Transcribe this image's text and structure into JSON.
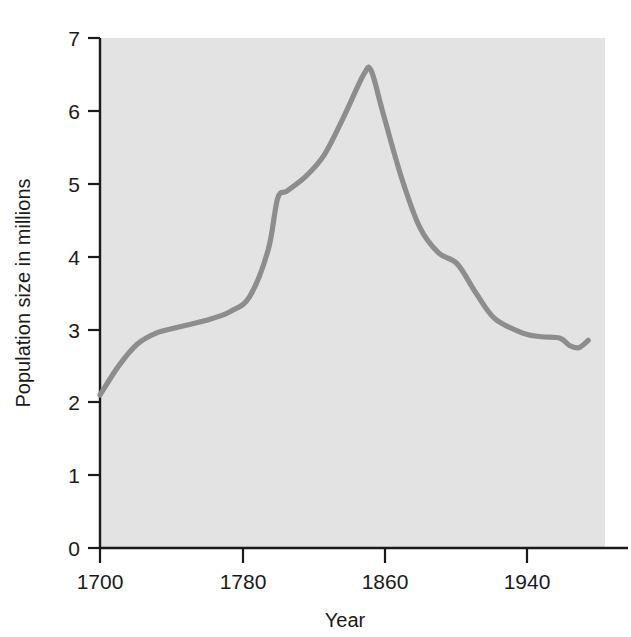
{
  "chart_data": {
    "type": "line",
    "title": "",
    "xlabel": "Year",
    "ylabel": "Population size in millions",
    "xlim": [
      1700,
      1970
    ],
    "ylim": [
      0,
      7
    ],
    "xticks": [
      1700,
      1780,
      1860,
      1940
    ],
    "xtick_labels": [
      "1700",
      "1780",
      "1860",
      "1940"
    ],
    "yticks": [
      0,
      1,
      2,
      3,
      4,
      5,
      6,
      7
    ],
    "ytick_labels": [
      "0",
      "1",
      "2",
      "3",
      "4",
      "5",
      "6",
      "7"
    ],
    "grid": false,
    "legend": false,
    "legend_position": "none",
    "series": [
      {
        "name": "Population size in millions",
        "color": "#8d8d8d",
        "x": [
          1700,
          1710,
          1720,
          1730,
          1740,
          1750,
          1760,
          1770,
          1780,
          1790,
          1795,
          1800,
          1810,
          1820,
          1830,
          1841,
          1845,
          1851,
          1861,
          1871,
          1881,
          1891,
          1901,
          1911,
          1926,
          1936,
          1946,
          1951,
          1956,
          1961
        ],
        "y": [
          2.1,
          2.5,
          2.8,
          2.95,
          3.02,
          3.08,
          3.15,
          3.25,
          3.45,
          4.1,
          4.8,
          4.9,
          5.1,
          5.4,
          5.9,
          6.5,
          6.55,
          6.0,
          5.1,
          4.4,
          4.05,
          3.9,
          3.5,
          3.15,
          2.95,
          2.9,
          2.88,
          2.78,
          2.75,
          2.85
        ]
      }
    ],
    "annotations": [],
    "background_color": "#e3e3e3",
    "page_color": "#ffffff",
    "axis_color": "#1a1a1a",
    "peak": {
      "year": 1845,
      "value": 6.55
    },
    "start": {
      "year": 1700,
      "value": 2.1
    },
    "end": {
      "year": 1961,
      "value": 2.85
    }
  },
  "figure": {
    "x_axis_title": "Year",
    "y_axis_title": "Population size in millions"
  }
}
